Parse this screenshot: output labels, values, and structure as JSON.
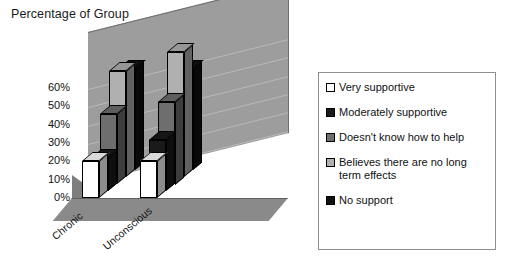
{
  "chart_data": {
    "type": "bar",
    "title": "Percentage of Group",
    "xlabel": "",
    "ylabel": "",
    "categories": [
      "Chronic",
      "Unconscious"
    ],
    "series": [
      {
        "name": "Very supportive",
        "values": [
          20,
          20
        ],
        "color": "#ffffff"
      },
      {
        "name": "Moderately supportive",
        "values": [
          18,
          28
        ],
        "color": "#1a1a1a"
      },
      {
        "name": "Doesn't know how to help",
        "values": [
          38,
          45
        ],
        "color": "#6e6e6e"
      },
      {
        "name": "Believes there are no long term effects",
        "values": [
          58,
          68
        ],
        "color": "#b0b0b0"
      },
      {
        "name": "No support",
        "values": [
          55,
          55
        ],
        "color": "#111111"
      }
    ],
    "ylim": [
      0,
      60
    ],
    "ytick_labels": [
      "60%",
      "50%",
      "40%",
      "30%",
      "20%",
      "10%",
      "0%"
    ],
    "ytick_values": [
      60,
      50,
      40,
      30,
      20,
      10,
      0
    ],
    "grid": true,
    "legend_position": "right",
    "projection": "3d-clustered-column"
  },
  "legend": {
    "items": [
      {
        "label": "Very supportive",
        "swatch": "#ffffff"
      },
      {
        "label": "Moderately supportive",
        "swatch": "#1a1a1a"
      },
      {
        "label": "Doesn't know how to help",
        "swatch": "#6e6e6e"
      },
      {
        "label": "Believes there are no long term effects",
        "swatch": "#b0b0b0"
      },
      {
        "label": "No support",
        "swatch": "#111111"
      }
    ]
  }
}
